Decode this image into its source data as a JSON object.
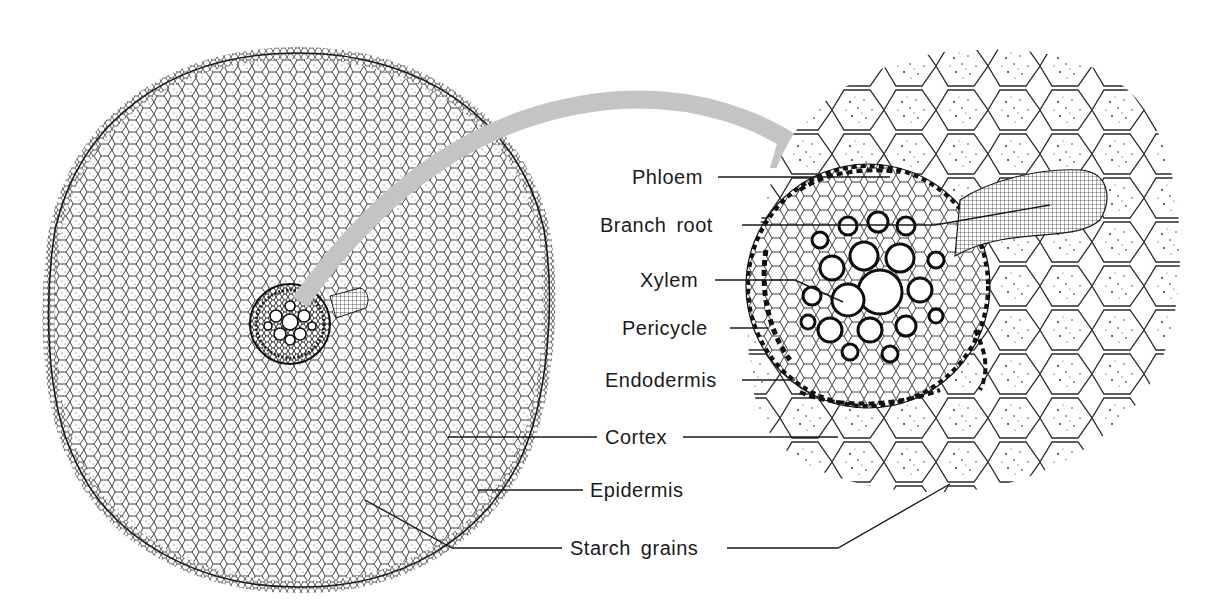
{
  "figure": {
    "panels": [
      {
        "id": "whole-root-section",
        "description": "Low-magnification cross-section of root"
      },
      {
        "id": "stele-detail",
        "description": "Magnified view of stele with emerging branch root"
      }
    ],
    "arrow": {
      "color": "#c4c4c4",
      "from": "whole-root-section",
      "to": "stele-detail"
    },
    "colors": {
      "ink": "#1a1a1a",
      "background": "#ffffff",
      "arrow": "#c4c4c4"
    }
  },
  "labels": {
    "phloem": "Phloem",
    "branch_root": "Branch root",
    "xylem": "Xylem",
    "pericycle": "Pericycle",
    "endodermis": "Endodermis",
    "cortex": "Cortex",
    "epidermis": "Epidermis",
    "starch_grains": "Starch grains"
  }
}
